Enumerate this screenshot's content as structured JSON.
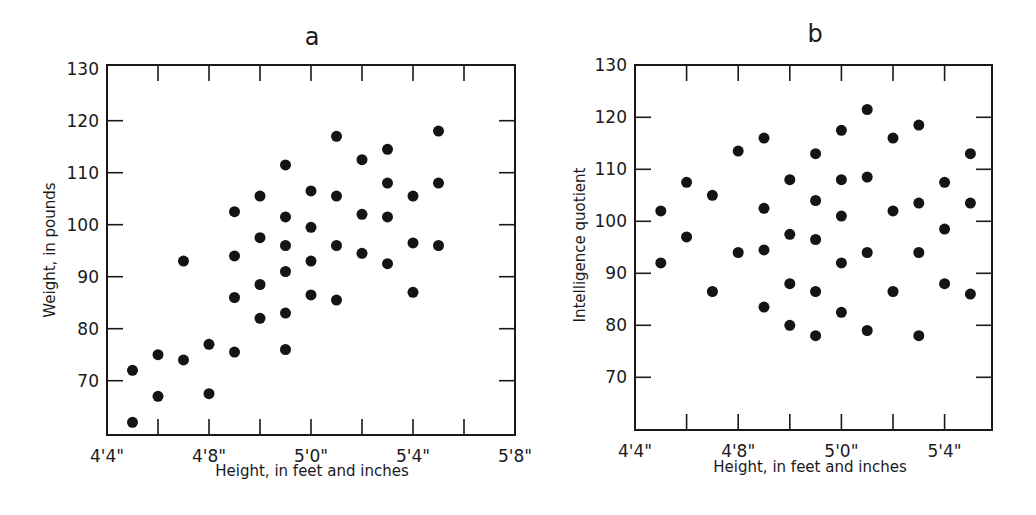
{
  "chart_data": [
    {
      "id": "a",
      "type": "scatter",
      "title": "a",
      "xlabel": "Height, in feet and inches",
      "ylabel": "Weight, in pounds",
      "x_unit": "inches",
      "xlim": [
        52,
        68
      ],
      "ylim": [
        60,
        130
      ],
      "x_ticks": [
        52,
        54,
        56,
        58,
        60,
        62,
        64,
        66,
        68
      ],
      "x_tick_labels": [
        {
          "value": 52,
          "label": "4'4\""
        },
        {
          "value": 56,
          "label": "4'8\""
        },
        {
          "value": 60,
          "label": "5'0\""
        },
        {
          "value": 64,
          "label": "5'4\""
        },
        {
          "value": 68,
          "label": "5'8\""
        }
      ],
      "y_ticks": [
        70,
        80,
        90,
        100,
        110,
        120,
        130
      ],
      "y_tick_labels": [
        "70",
        "80",
        "90",
        "100",
        "110",
        "120",
        "130"
      ],
      "grid": false,
      "points": [
        {
          "x": 53,
          "y": 72
        },
        {
          "x": 53,
          "y": 62
        },
        {
          "x": 54,
          "y": 75
        },
        {
          "x": 54,
          "y": 67
        },
        {
          "x": 55,
          "y": 93
        },
        {
          "x": 55,
          "y": 74
        },
        {
          "x": 56,
          "y": 77
        },
        {
          "x": 56,
          "y": 67.5
        },
        {
          "x": 57,
          "y": 102.5
        },
        {
          "x": 57,
          "y": 94
        },
        {
          "x": 57,
          "y": 86
        },
        {
          "x": 57,
          "y": 75.5
        },
        {
          "x": 58,
          "y": 105.5
        },
        {
          "x": 58,
          "y": 97.5
        },
        {
          "x": 58,
          "y": 88.5
        },
        {
          "x": 58,
          "y": 82
        },
        {
          "x": 59,
          "y": 111.5
        },
        {
          "x": 59,
          "y": 101.5
        },
        {
          "x": 59,
          "y": 96
        },
        {
          "x": 59,
          "y": 91
        },
        {
          "x": 59,
          "y": 83
        },
        {
          "x": 59,
          "y": 76
        },
        {
          "x": 60,
          "y": 106.5
        },
        {
          "x": 60,
          "y": 99.5
        },
        {
          "x": 60,
          "y": 93
        },
        {
          "x": 60,
          "y": 86.5
        },
        {
          "x": 61,
          "y": 117
        },
        {
          "x": 61,
          "y": 105.5
        },
        {
          "x": 61,
          "y": 96
        },
        {
          "x": 61,
          "y": 85.5
        },
        {
          "x": 62,
          "y": 112.5
        },
        {
          "x": 62,
          "y": 102
        },
        {
          "x": 62,
          "y": 94.5
        },
        {
          "x": 63,
          "y": 114.5
        },
        {
          "x": 63,
          "y": 108
        },
        {
          "x": 63,
          "y": 101.5
        },
        {
          "x": 63,
          "y": 92.5
        },
        {
          "x": 64,
          "y": 105.5
        },
        {
          "x": 64,
          "y": 96.5
        },
        {
          "x": 64,
          "y": 87
        },
        {
          "x": 65,
          "y": 118
        },
        {
          "x": 65,
          "y": 108
        },
        {
          "x": 65,
          "y": 96
        }
      ]
    },
    {
      "id": "b",
      "type": "scatter",
      "title": "b",
      "xlabel": "Height, in feet and inches",
      "ylabel": "Intelligence quotient",
      "x_unit": "inches",
      "xlim": [
        52,
        66
      ],
      "ylim": [
        60,
        130
      ],
      "x_ticks": [
        52,
        54,
        56,
        58,
        60,
        62,
        64,
        66
      ],
      "x_tick_labels": [
        {
          "value": 52,
          "label": "4'4\""
        },
        {
          "value": 56,
          "label": "4'8\""
        },
        {
          "value": 60,
          "label": "5'0\""
        },
        {
          "value": 64,
          "label": "5'4\""
        }
      ],
      "y_ticks": [
        70,
        80,
        90,
        100,
        110,
        120,
        130
      ],
      "y_tick_labels": [
        "70",
        "80",
        "90",
        "100",
        "110",
        "120",
        "130"
      ],
      "grid": false,
      "points": [
        {
          "x": 53,
          "y": 102
        },
        {
          "x": 53,
          "y": 92
        },
        {
          "x": 54,
          "y": 107.5
        },
        {
          "x": 54,
          "y": 97
        },
        {
          "x": 55,
          "y": 105
        },
        {
          "x": 55,
          "y": 86.5
        },
        {
          "x": 56,
          "y": 113.5
        },
        {
          "x": 56,
          "y": 94
        },
        {
          "x": 57,
          "y": 116
        },
        {
          "x": 57,
          "y": 102.5
        },
        {
          "x": 57,
          "y": 94.5
        },
        {
          "x": 57,
          "y": 83.5
        },
        {
          "x": 58,
          "y": 108
        },
        {
          "x": 58,
          "y": 97.5
        },
        {
          "x": 58,
          "y": 88
        },
        {
          "x": 58,
          "y": 80
        },
        {
          "x": 59,
          "y": 113
        },
        {
          "x": 59,
          "y": 104
        },
        {
          "x": 59,
          "y": 96.5
        },
        {
          "x": 59,
          "y": 86.5
        },
        {
          "x": 59,
          "y": 78
        },
        {
          "x": 60,
          "y": 117.5
        },
        {
          "x": 60,
          "y": 108
        },
        {
          "x": 60,
          "y": 101
        },
        {
          "x": 60,
          "y": 92
        },
        {
          "x": 60,
          "y": 82.5
        },
        {
          "x": 61,
          "y": 121.5
        },
        {
          "x": 61,
          "y": 108.5
        },
        {
          "x": 61,
          "y": 94
        },
        {
          "x": 61,
          "y": 79
        },
        {
          "x": 62,
          "y": 116
        },
        {
          "x": 62,
          "y": 102
        },
        {
          "x": 62,
          "y": 86.5
        },
        {
          "x": 63,
          "y": 118.5
        },
        {
          "x": 63,
          "y": 103.5
        },
        {
          "x": 63,
          "y": 94
        },
        {
          "x": 63,
          "y": 78
        },
        {
          "x": 64,
          "y": 107.5
        },
        {
          "x": 64,
          "y": 98.5
        },
        {
          "x": 64,
          "y": 88
        },
        {
          "x": 65,
          "y": 113
        },
        {
          "x": 65,
          "y": 103.5
        },
        {
          "x": 65,
          "y": 86
        }
      ]
    }
  ]
}
